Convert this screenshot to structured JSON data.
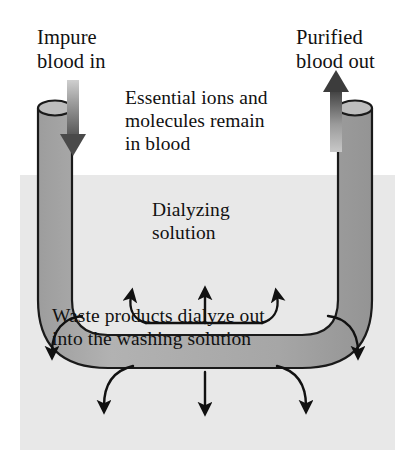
{
  "figure": {
    "canvas": {
      "width": 411,
      "height": 464
    },
    "colors": {
      "page_background": "#ffffff",
      "bath_background": "#e8e8e8",
      "tube_fill": "#a9a9a9",
      "tube_fill_light": "#b4b4b4",
      "outline": "#1a1a1a",
      "text": "#111111",
      "flow_arrow": "#5a5a5a"
    }
  },
  "labels": {
    "impure_blood_in": "Impure\nblood in",
    "purified_blood_out": "Purified\nblood out",
    "essential_ions": "Essential ions and\nmolecules remain\nin blood",
    "dialyzing_solution": "Dialyzing\nsolution",
    "waste_products": "Waste products dialyze out\ninto the washing solution"
  },
  "elements": {
    "left_tube": "impure-blood-inlet-tube",
    "right_tube": "purified-blood-outlet-tube",
    "u_bend": "dialysis-membrane-u-tube",
    "bath": "washing-solution-bath",
    "inflow_arrow": "blood-inflow-arrow",
    "outflow_arrow": "blood-outflow-arrow",
    "inward_arrow_count": 3,
    "outward_arrow_count": 5
  }
}
